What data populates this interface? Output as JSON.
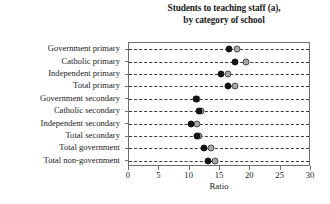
{
  "chart_data": {
    "type": "scatter",
    "title": "Students to teaching staff (a), by category of school",
    "title_lines": [
      "Students to teaching staff (a),",
      "by category of school"
    ],
    "xlabel": "Ratio",
    "ylabel": "",
    "xlim": [
      0,
      30
    ],
    "xticks": [
      0,
      5,
      10,
      15,
      20,
      25,
      30
    ],
    "xticklabels": [
      "0",
      "5",
      "10",
      "15",
      "20",
      "25",
      "30"
    ],
    "grid": "horizontal-dashed",
    "legend_position": "inside-top-right",
    "categories": [
      "Government primary",
      "Catholic primary",
      "Independent primary",
      "Total primary",
      "Government secondary",
      "Catholic secondary",
      "Independent secondary",
      "Total secondary",
      "Total government",
      "Total non-government"
    ],
    "series": [
      {
        "name": "2008",
        "color": "#a8a8a8",
        "marker": "circle-open-gray",
        "values": [
          17.8,
          19.3,
          16.3,
          17.4,
          11.2,
          11.9,
          11.2,
          11.5,
          13.5,
          14.2
        ]
      },
      {
        "name": "2018",
        "color": "#131313",
        "marker": "circle-filled-black",
        "values": [
          16.5,
          17.5,
          15.2,
          16.3,
          11.0,
          11.6,
          10.2,
          11.2,
          12.4,
          13.0
        ]
      }
    ]
  },
  "legend": {
    "entries": [
      {
        "label": "2008",
        "key": "y2008"
      },
      {
        "label": "2018",
        "key": "y2018"
      }
    ]
  },
  "colors": {
    "series_2008": "#a8a8a8",
    "series_2018": "#131313",
    "axis": "#6e6e6e",
    "grid": "#3a3a3a",
    "text": "#1b1b1b",
    "background": "#ffffff"
  }
}
